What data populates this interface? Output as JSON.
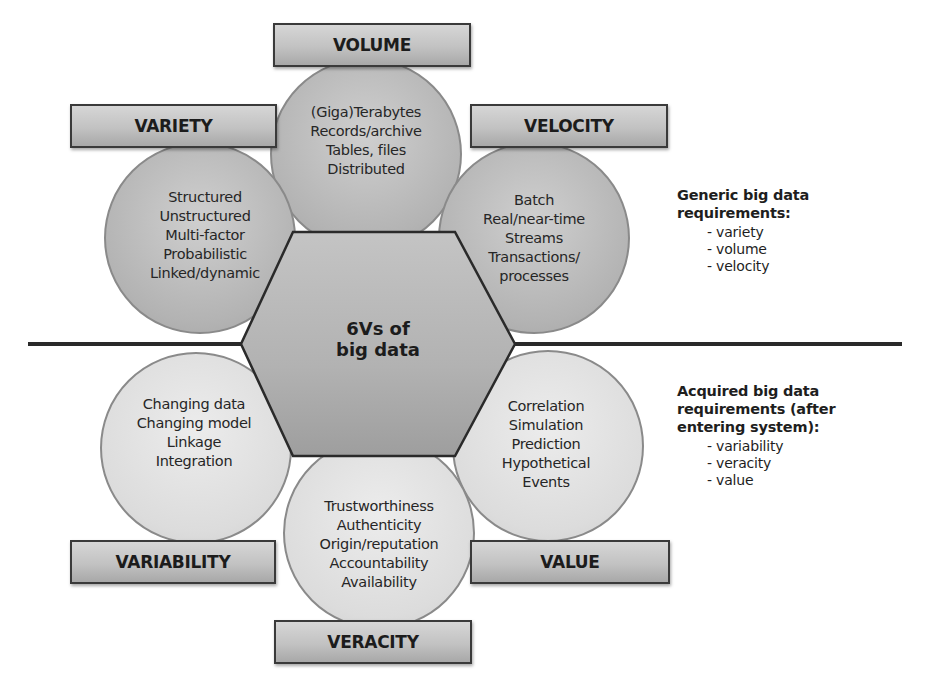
{
  "diagram": {
    "center": {
      "line1": "6Vs of",
      "line2": "big data"
    },
    "vs": [
      {
        "name": "VOLUME",
        "items": [
          "(Giga)Terabytes",
          "Records/archive",
          "Tables, files",
          "Distributed"
        ]
      },
      {
        "name": "VARIETY",
        "items": [
          "Structured",
          "Unstructured",
          "Multi-factor",
          "Probabilistic",
          "Linked/dynamic"
        ]
      },
      {
        "name": "VELOCITY",
        "items": [
          "Batch",
          "Real/near-time",
          "Streams",
          "Transactions/",
          "processes"
        ]
      },
      {
        "name": "VARIABILITY",
        "items": [
          "Changing data",
          "Changing model",
          "Linkage",
          "Integration"
        ]
      },
      {
        "name": "VALUE",
        "items": [
          "Correlation",
          "Simulation",
          "Prediction",
          "Hypothetical",
          "Events"
        ]
      },
      {
        "name": "VERACITY",
        "items": [
          "Trustworthiness",
          "Authenticity",
          "Origin/reputation",
          "Accountability",
          "Availability"
        ]
      }
    ],
    "generic": {
      "title_line1": "Generic big data",
      "title_line2": "requirements:",
      "items": [
        "- variety",
        "- volume",
        "- velocity"
      ]
    },
    "acquired": {
      "title_line1": "Acquired big data",
      "title_line2": "requirements (after",
      "title_line3": "entering system):",
      "items": [
        "- variability",
        "- veracity",
        "- value"
      ]
    }
  },
  "colors": {
    "upper_circles": "#b8b8b8",
    "lower_circles": "#dcdcdc",
    "hexagon": "#b0b0b0",
    "divider_line": "#2a2a2a",
    "label_box": "#c2c2c2"
  }
}
